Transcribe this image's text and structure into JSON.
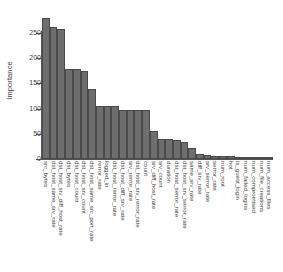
{
  "chart_data": {
    "type": "bar",
    "title": "",
    "subtitle": "",
    "xlabel": "",
    "ylabel": "Importance",
    "ylim": [
      0,
      285
    ],
    "yticks": [
      0,
      50,
      100,
      150,
      200,
      250
    ],
    "ytick_labels": [
      "0",
      "50",
      "100",
      "150",
      "200",
      "250"
    ],
    "grid": false,
    "legend": null,
    "orientation": "vertical",
    "bar_color": "#6e6e6e",
    "bar_edge_color": "#4a4a4a",
    "axis_color": "#555555",
    "text_color": "#3b3b3b",
    "background": "#ffffff",
    "categories": [
      "src_bytes",
      "dst_host_same_srv_rate",
      "dst_host_srv_diff_host_rate",
      "dst_bytes",
      "dst_host_count",
      "dst_host_srv_count",
      "dst_host_same_src_port_rate",
      "rerror_rate",
      "logged_in",
      "dst_host_rerror_rate",
      "dst_host_diff_srv_rate",
      "srv_rerror_rate",
      "dst_host_srv_rerror_rate",
      "count",
      "srv_diff_host_rate",
      "srv_count",
      "duration",
      "dst_host_serror_rate",
      "dst_host_srv_serror_rate",
      "same_srv_rate",
      "diff_srv_rate",
      "srv_serror_rate",
      "serror_rate",
      "num_root",
      "hot",
      "is_guest_login",
      "num_failed_logins",
      "num_compromised",
      "num_file_creations",
      "num_access_files"
    ],
    "values": [
      280,
      262,
      257,
      179,
      178,
      175,
      139,
      106,
      105,
      105,
      98,
      97,
      97,
      97,
      56,
      40,
      39,
      38,
      34,
      22,
      9,
      8,
      6,
      5,
      5,
      4,
      3,
      2,
      1,
      1
    ]
  }
}
